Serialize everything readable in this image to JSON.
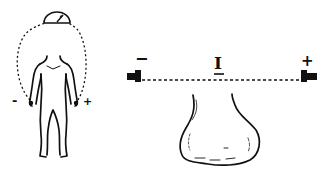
{
  "left_diagram": {
    "description": "human body with meter circuit",
    "meter_icon": "galvanometer-icon",
    "negative_label": "-",
    "positive_label": "+"
  },
  "right_diagram": {
    "description": "current across tissue between electrodes",
    "current_label": "I",
    "negative_label": "−",
    "positive_label": "+"
  },
  "colors": {
    "stroke": "#111111",
    "background": "#ffffff"
  }
}
